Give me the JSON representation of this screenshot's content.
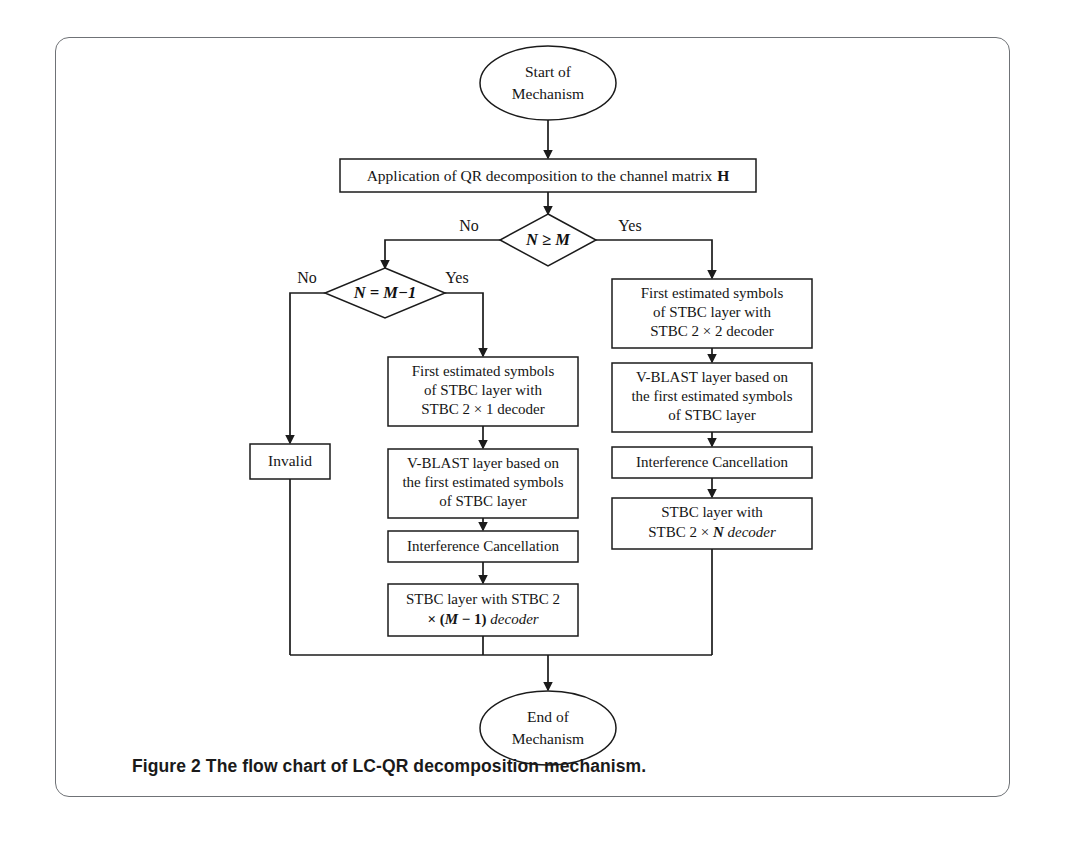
{
  "figure": {
    "caption_label": "Figure 2",
    "caption_text": "The flow chart of LC-QR decomposition mechanism."
  },
  "flowchart": {
    "type": "flowchart",
    "title": "The flow chart of LC-QR decomposition mechanism",
    "nodes": {
      "start": {
        "shape": "ellipse",
        "line1": "Start of",
        "line2": "Mechanism"
      },
      "qr_step": {
        "shape": "process",
        "line1": "Application of QR decomposition to the channel matrix",
        "matrix_symbol": "H"
      },
      "decision_nm": {
        "shape": "decision",
        "text": "N ≥ M",
        "yes_label": "Yes",
        "no_label": "No"
      },
      "decision_nm1": {
        "shape": "decision",
        "text": "N = M−1",
        "yes_label": "Yes",
        "no_label": "No"
      },
      "invalid": {
        "shape": "process",
        "line1": "Invalid"
      },
      "mid_first_est": {
        "shape": "process",
        "line1": "First estimated symbols",
        "line2": "of STBC layer with",
        "line3": "STBC 2 × 1 decoder"
      },
      "mid_vblast": {
        "shape": "process",
        "line1": "V-BLAST layer based on",
        "line2": "the first estimated symbols",
        "line3": "of STBC layer"
      },
      "mid_interference": {
        "shape": "process",
        "line1": "Interference Cancellation"
      },
      "mid_stbc_layer": {
        "shape": "process",
        "line1": "STBC layer with STBC 2",
        "line2_prefix": "× (",
        "line2_var": "M",
        "line2_mid": " − 1) ",
        "line2_suffix": "decoder"
      },
      "right_first_est": {
        "shape": "process",
        "line1": "First estimated symbols",
        "line2": "of STBC layer with",
        "line3": "STBC 2 × 2 decoder"
      },
      "right_vblast": {
        "shape": "process",
        "line1": "V-BLAST layer based on",
        "line2": "the first estimated symbols",
        "line3": "of STBC layer"
      },
      "right_interference": {
        "shape": "process",
        "line1": "Interference Cancellation"
      },
      "right_stbc_layer": {
        "shape": "process",
        "line1": "STBC layer with",
        "line2_prefix": "STBC 2 × ",
        "line2_var": "N",
        "line2_suffix": " decoder"
      },
      "end": {
        "shape": "ellipse",
        "line1": "End of",
        "line2": "Mechanism"
      }
    },
    "edges": [
      {
        "from": "start",
        "to": "qr_step",
        "label": ""
      },
      {
        "from": "qr_step",
        "to": "decision_nm",
        "label": ""
      },
      {
        "from": "decision_nm",
        "to": "right_first_est",
        "label": "Yes"
      },
      {
        "from": "decision_nm",
        "to": "decision_nm1",
        "label": "No"
      },
      {
        "from": "decision_nm1",
        "to": "mid_first_est",
        "label": "Yes"
      },
      {
        "from": "decision_nm1",
        "to": "invalid",
        "label": "No"
      },
      {
        "from": "mid_first_est",
        "to": "mid_vblast",
        "label": ""
      },
      {
        "from": "mid_vblast",
        "to": "mid_interference",
        "label": ""
      },
      {
        "from": "mid_interference",
        "to": "mid_stbc_layer",
        "label": ""
      },
      {
        "from": "mid_stbc_layer",
        "to": "end",
        "label": ""
      },
      {
        "from": "right_first_est",
        "to": "right_vblast",
        "label": ""
      },
      {
        "from": "right_vblast",
        "to": "right_interference",
        "label": ""
      },
      {
        "from": "right_interference",
        "to": "right_stbc_layer",
        "label": ""
      },
      {
        "from": "right_stbc_layer",
        "to": "end",
        "label": ""
      },
      {
        "from": "invalid",
        "to": "end",
        "label": ""
      }
    ],
    "colors": {
      "stroke": "#1b1b1b",
      "fill": "#ffffff",
      "frame": "#6f7276",
      "text": "#151515"
    }
  }
}
